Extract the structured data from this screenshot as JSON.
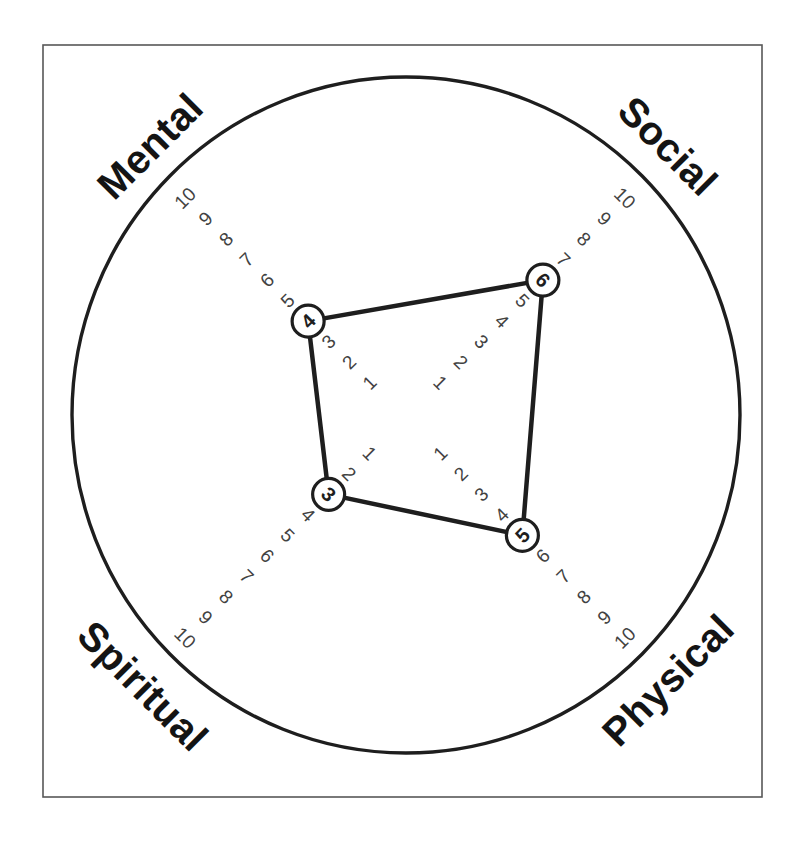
{
  "page": {
    "background": "#ffffff"
  },
  "chart_data": {
    "type": "radar",
    "variant": "wheel-of-life",
    "title": "",
    "legend": "none",
    "grid": "off",
    "outer_ring": true,
    "axes": [
      {
        "label": "Mental",
        "value": 4
      },
      {
        "label": "Social",
        "value": 6
      },
      {
        "label": "Physical",
        "value": 5
      },
      {
        "label": "Spiritual",
        "value": 3
      }
    ],
    "scale": {
      "min": 1,
      "max": 10,
      "step": 1,
      "ticks": [
        1,
        2,
        3,
        4,
        5,
        6,
        7,
        8,
        9,
        10
      ]
    },
    "layout": {
      "center": [
        405,
        418
      ],
      "radius_base": 21,
      "radius_step": 29,
      "outer_ring": {
        "cx": 406,
        "cy": 415,
        "rx": 334,
        "ry": 338
      },
      "frame": {
        "x": 43,
        "y": 45,
        "width": 719,
        "height": 752
      },
      "point_radius": 16,
      "axes_layout": {
        "Mental": {
          "dx": -0.70711,
          "dy": -0.70711,
          "text_rotation": -45,
          "label_pos": [
            150,
            146
          ]
        },
        "Social": {
          "dx": 0.70711,
          "dy": -0.70711,
          "text_rotation": 45,
          "label_pos": [
            668,
            146
          ]
        },
        "Physical": {
          "dx": 0.70711,
          "dy": 0.70711,
          "text_rotation": -45,
          "label_pos": [
            668,
            680
          ]
        },
        "Spiritual": {
          "dx": -0.70711,
          "dy": 0.70711,
          "text_rotation": 45,
          "label_pos": [
            143,
            686
          ]
        }
      }
    },
    "colors": {
      "ink": "#1e1e1e",
      "tick_text": "#424242",
      "label_text": "#141414",
      "frame": "#585858",
      "point_fill": "#ffffff",
      "background": "#ffffff"
    }
  }
}
